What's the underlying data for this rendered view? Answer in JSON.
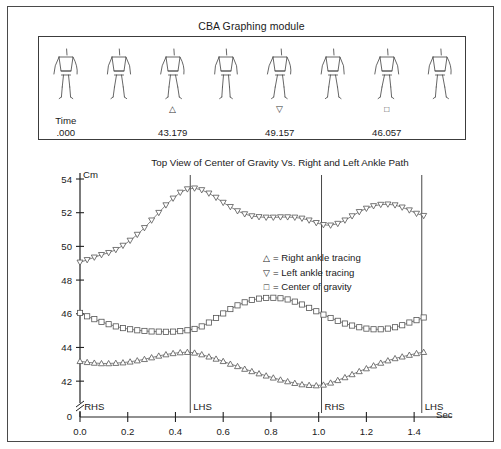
{
  "module": {
    "title": "CBA Graphing module",
    "time_label": "Time",
    "frames": [
      {
        "glyph": "",
        "value": ".000"
      },
      {
        "glyph": "",
        "value": ""
      },
      {
        "glyph": "△",
        "value": "43.179"
      },
      {
        "glyph": "",
        "value": ""
      },
      {
        "glyph": "▽",
        "value": "49.157"
      },
      {
        "glyph": "",
        "value": ""
      },
      {
        "glyph": "□",
        "value": "46.057"
      },
      {
        "glyph": "",
        "value": ""
      }
    ],
    "figure_count": 8
  },
  "chart_data": {
    "type": "line",
    "title": "Top View of Center of Gravity Vs. Right and Left Ankle Path",
    "xlabel": "Sec",
    "ylabel": "Cm",
    "xlim": [
      0.0,
      1.5
    ],
    "ylim": [
      41.0,
      54.0
    ],
    "y_axis_broken": true,
    "y_zero_label": "0",
    "grid": false,
    "legend_position": "center-right",
    "xticks": [
      0.0,
      0.2,
      0.4,
      0.6,
      0.8,
      1.0,
      1.2,
      1.4
    ],
    "xtick_labels": [
      "0.0",
      "0.2",
      "0.4",
      "0.6",
      "0.8",
      "1.0",
      "1.2",
      "1.4"
    ],
    "yticks": [
      42,
      44,
      46,
      48,
      50,
      52,
      54
    ],
    "ytick_labels": [
      "42",
      "44",
      "46",
      "48",
      "50",
      "52",
      "54"
    ],
    "events": [
      {
        "label": "RHS",
        "t": 0.005
      },
      {
        "label": "LHS",
        "t": 0.462
      },
      {
        "label": "RHS",
        "t": 1.012
      },
      {
        "label": "LHS",
        "t": 1.432
      }
    ],
    "x": [
      0.0,
      0.03,
      0.06,
      0.09,
      0.12,
      0.15,
      0.18,
      0.21,
      0.24,
      0.27,
      0.3,
      0.33,
      0.36,
      0.39,
      0.42,
      0.45,
      0.48,
      0.51,
      0.54,
      0.57,
      0.6,
      0.63,
      0.66,
      0.69,
      0.72,
      0.75,
      0.78,
      0.81,
      0.84,
      0.87,
      0.9,
      0.93,
      0.96,
      0.99,
      1.02,
      1.05,
      1.08,
      1.11,
      1.14,
      1.17,
      1.2,
      1.23,
      1.26,
      1.29,
      1.32,
      1.35,
      1.38,
      1.41,
      1.44
    ],
    "series": [
      {
        "name": "Left ankle tracing",
        "marker": "triangle-down",
        "values": [
          49.05,
          49.2,
          49.35,
          49.5,
          49.62,
          49.8,
          50.05,
          50.35,
          50.7,
          51.1,
          51.55,
          52.0,
          52.45,
          52.85,
          53.2,
          53.4,
          53.45,
          53.35,
          53.15,
          52.9,
          52.6,
          52.35,
          52.1,
          51.92,
          51.8,
          51.75,
          51.72,
          51.72,
          51.74,
          51.74,
          51.72,
          51.66,
          51.55,
          51.4,
          51.28,
          51.25,
          51.35,
          51.55,
          51.8,
          52.05,
          52.25,
          52.4,
          52.48,
          52.5,
          52.45,
          52.32,
          52.15,
          51.95,
          51.82
        ]
      },
      {
        "name": "Center of gravity",
        "marker": "square",
        "values": [
          46.05,
          45.85,
          45.68,
          45.52,
          45.38,
          45.25,
          45.15,
          45.08,
          45.02,
          44.98,
          44.95,
          44.94,
          44.93,
          44.94,
          44.97,
          45.02,
          45.1,
          45.25,
          45.48,
          45.75,
          46.02,
          46.28,
          46.5,
          46.68,
          46.82,
          46.9,
          46.94,
          46.95,
          46.92,
          46.85,
          46.72,
          46.55,
          46.35,
          46.15,
          45.95,
          45.75,
          45.58,
          45.42,
          45.3,
          45.2,
          45.12,
          45.08,
          45.08,
          45.12,
          45.2,
          45.32,
          45.48,
          45.62,
          45.78
        ]
      },
      {
        "name": "Right ankle tracing",
        "marker": "triangle-up",
        "values": [
          43.18,
          43.12,
          43.08,
          43.05,
          43.05,
          43.07,
          43.1,
          43.15,
          43.22,
          43.3,
          43.4,
          43.5,
          43.58,
          43.65,
          43.7,
          43.72,
          43.68,
          43.58,
          43.45,
          43.32,
          43.18,
          43.02,
          42.88,
          42.72,
          42.58,
          42.45,
          42.32,
          42.2,
          42.08,
          41.98,
          41.88,
          41.8,
          41.76,
          41.74,
          41.78,
          41.9,
          42.05,
          42.22,
          42.4,
          42.58,
          42.75,
          42.92,
          43.08,
          43.22,
          43.35,
          43.45,
          43.55,
          43.65,
          43.72
        ]
      }
    ],
    "legend": [
      {
        "symbol": "△",
        "eq": "=",
        "text": "Right ankle tracing"
      },
      {
        "symbol": "▽",
        "eq": "=",
        "text": "Left ankle tracing"
      },
      {
        "symbol": "□",
        "eq": "=",
        "text": "Center of gravity"
      }
    ]
  }
}
